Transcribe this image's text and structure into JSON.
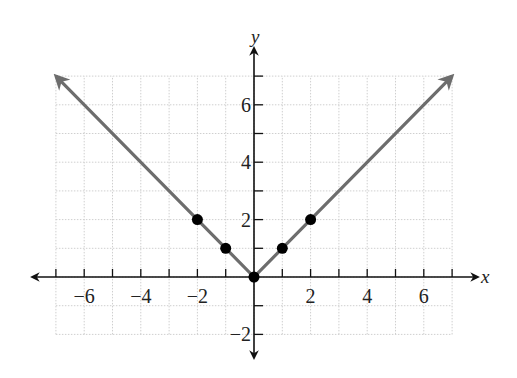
{
  "chart_data": {
    "type": "line",
    "title": "",
    "xlabel": "x",
    "ylabel": "y",
    "xlim": [
      -7,
      7
    ],
    "ylim": [
      -2,
      7
    ],
    "grid": true,
    "x_ticks": [
      -6,
      -4,
      -2,
      2,
      4,
      6
    ],
    "y_ticks": [
      -2,
      2,
      4,
      6
    ],
    "x_tick_labels": [
      "−6",
      "−4",
      "−2",
      "2",
      "4",
      "6"
    ],
    "y_tick_labels": [
      "−2",
      "2",
      "4",
      "6"
    ],
    "series": [
      {
        "name": "y = |x|",
        "style": "line-with-arrows",
        "color": "#6d6d6d",
        "x": [
          -7,
          0,
          7
        ],
        "y": [
          7,
          0,
          7
        ]
      },
      {
        "name": "plotted points",
        "style": "scatter",
        "color": "#000000",
        "x": [
          -2,
          -1,
          0,
          1,
          2
        ],
        "y": [
          2,
          1,
          0,
          1,
          2
        ]
      }
    ]
  },
  "labels": {
    "x_axis": "x",
    "y_axis": "y"
  }
}
